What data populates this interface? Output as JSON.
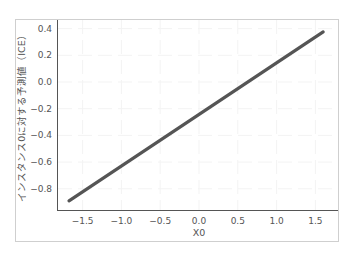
{
  "chart_data": {
    "type": "line",
    "title": "",
    "xlabel": "X0",
    "ylabel": "インスタンス0に対する予測値（ICE）",
    "x_ticks": [
      "−1.5",
      "−1.0",
      "−0.5",
      "0.0",
      "0.5",
      "1.0",
      "1.5"
    ],
    "x_tick_values": [
      -1.5,
      -1.0,
      -0.5,
      0.0,
      0.5,
      1.0,
      1.5
    ],
    "y_ticks": [
      "0.4",
      "0.2",
      "0.0",
      "−0.2",
      "−0.4",
      "−0.6",
      "−0.8"
    ],
    "y_tick_values": [
      0.4,
      0.2,
      0.0,
      -0.2,
      -0.4,
      -0.6,
      -0.8
    ],
    "xlim": [
      -1.85,
      1.8
    ],
    "ylim": [
      -0.95,
      0.42
    ],
    "grid": true,
    "legend": null,
    "series": [
      {
        "name": "ICE",
        "color": "#555555",
        "x": [
          -1.675,
          1.6
        ],
        "y": [
          -0.89,
          0.375
        ]
      }
    ]
  }
}
